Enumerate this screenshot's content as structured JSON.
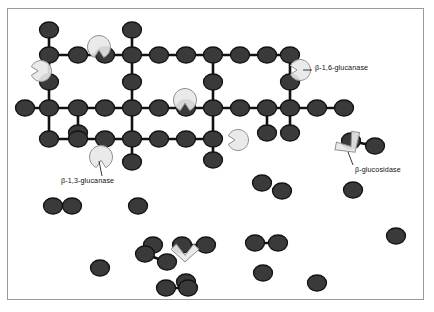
{
  "figure": {
    "background_color": "#ffffff",
    "border_color": "#9a9a9a",
    "unit_color": "#3a3a3a",
    "unit_stroke_color": "#121212",
    "bond_color": "#121212",
    "enzyme_fill_color": "#e8e8e8",
    "enzyme_stroke_color": "#8f8f8f",
    "leader_color": "#222222",
    "text_color": "#111111"
  },
  "labels": [
    {
      "id": "beta-1-6-glucanase",
      "text": "β-1,6-glucanase",
      "x": 315,
      "y": 68,
      "leader": {
        "x1": 303,
        "y1": 70,
        "x2": 312,
        "y2": 70
      }
    },
    {
      "id": "beta-1-3-glucanase",
      "text": "β-1,3-glucanase",
      "x": 61,
      "y": 181,
      "leader": {
        "x1": 102,
        "y1": 176,
        "x2": 99,
        "y2": 161
      }
    },
    {
      "id": "beta-glucosidase",
      "text": "β-glucosidase",
      "x": 355,
      "y": 170,
      "leader": {
        "x1": 353,
        "y1": 165,
        "x2": 348,
        "y2": 152
      }
    }
  ],
  "network": {
    "description": "Cross-linked beta-glucan polymer: glucose units joined by backbone and branch bonds",
    "unit_rx": 9.5,
    "unit_ry": 8.0,
    "bond_width": 2.6,
    "bonds": [
      [
        49,
        30,
        49,
        55
      ],
      [
        49,
        55,
        49,
        82
      ],
      [
        49,
        82,
        49,
        108
      ],
      [
        49,
        108,
        49,
        139
      ],
      [
        49,
        55,
        78,
        55
      ],
      [
        78,
        55,
        105,
        55
      ],
      [
        105,
        55,
        132,
        55
      ],
      [
        132,
        55,
        159,
        55
      ],
      [
        159,
        55,
        186,
        55
      ],
      [
        186,
        55,
        213,
        55
      ],
      [
        213,
        55,
        240,
        55
      ],
      [
        240,
        55,
        267,
        55
      ],
      [
        267,
        55,
        290,
        55
      ],
      [
        132,
        30,
        132,
        55
      ],
      [
        132,
        55,
        132,
        82
      ],
      [
        132,
        82,
        132,
        108
      ],
      [
        132,
        108,
        132,
        139
      ],
      [
        132,
        139,
        132,
        162
      ],
      [
        213,
        55,
        213,
        82
      ],
      [
        213,
        82,
        213,
        108
      ],
      [
        213,
        108,
        213,
        139
      ],
      [
        213,
        139,
        213,
        160
      ],
      [
        290,
        55,
        290,
        82
      ],
      [
        290,
        82,
        290,
        108
      ],
      [
        290,
        108,
        290,
        133
      ],
      [
        25,
        108,
        49,
        108
      ],
      [
        49,
        108,
        78,
        108
      ],
      [
        78,
        108,
        105,
        108
      ],
      [
        105,
        108,
        132,
        108
      ],
      [
        132,
        108,
        159,
        108
      ],
      [
        159,
        108,
        186,
        108
      ],
      [
        186,
        108,
        213,
        108
      ],
      [
        213,
        108,
        240,
        108
      ],
      [
        240,
        108,
        267,
        108
      ],
      [
        267,
        108,
        290,
        108
      ],
      [
        290,
        108,
        317,
        108
      ],
      [
        317,
        108,
        344,
        108
      ],
      [
        78,
        108,
        78,
        133
      ],
      [
        49,
        139,
        78,
        139
      ],
      [
        78,
        139,
        105,
        139
      ],
      [
        105,
        139,
        132,
        139
      ],
      [
        132,
        139,
        159,
        139
      ],
      [
        159,
        139,
        186,
        139
      ],
      [
        186,
        139,
        213,
        139
      ],
      [
        78,
        133,
        78,
        139
      ],
      [
        267,
        108,
        267,
        133
      ]
    ],
    "units": [
      [
        49,
        30
      ],
      [
        49,
        55
      ],
      [
        49,
        82
      ],
      [
        49,
        108
      ],
      [
        49,
        139
      ],
      [
        78,
        55
      ],
      [
        105,
        55
      ],
      [
        132,
        55
      ],
      [
        159,
        55
      ],
      [
        186,
        55
      ],
      [
        213,
        55
      ],
      [
        240,
        55
      ],
      [
        267,
        55
      ],
      [
        290,
        55
      ],
      [
        132,
        30
      ],
      [
        132,
        82
      ],
      [
        132,
        108
      ],
      [
        132,
        139
      ],
      [
        132,
        162
      ],
      [
        213,
        82
      ],
      [
        213,
        108
      ],
      [
        213,
        139
      ],
      [
        213,
        160
      ],
      [
        290,
        82
      ],
      [
        290,
        108
      ],
      [
        290,
        133
      ],
      [
        25,
        108
      ],
      [
        78,
        108
      ],
      [
        105,
        108
      ],
      [
        159,
        108
      ],
      [
        186,
        108
      ],
      [
        240,
        108
      ],
      [
        267,
        108
      ],
      [
        317,
        108
      ],
      [
        344,
        108
      ],
      [
        78,
        133
      ],
      [
        78,
        139
      ],
      [
        105,
        139
      ],
      [
        159,
        139
      ],
      [
        186,
        139
      ],
      [
        267,
        133
      ]
    ]
  },
  "enzymes": [
    {
      "id": "glucanase-top-left",
      "type": "pacman",
      "x": 99,
      "y": 47,
      "r": 11.5,
      "notch": "down"
    },
    {
      "id": "glucanase-left-edge",
      "type": "pacman",
      "x": 41,
      "y": 71,
      "r": 10.5,
      "notch": "left"
    },
    {
      "id": "glucanase-middle",
      "type": "pacman",
      "x": 185,
      "y": 100,
      "r": 11.5,
      "notch": "down"
    },
    {
      "id": "glucanase-right",
      "type": "pacman",
      "x": 300,
      "y": 70,
      "r": 10.5,
      "notch": "left"
    },
    {
      "id": "glucanase-lower-right",
      "type": "pacman",
      "x": 238,
      "y": 140,
      "r": 10.5,
      "notch": "left"
    },
    {
      "id": "glucanase-bottom-left",
      "type": "pacman",
      "x": 101,
      "y": 157,
      "r": 11.5,
      "notch": "down"
    },
    {
      "id": "glucosidase-right",
      "type": "chevron",
      "x": 352,
      "y": 148,
      "size": 15,
      "rotation": -35
    },
    {
      "id": "glucosidase-bottom",
      "type": "chevron",
      "x": 185,
      "y": 257,
      "size": 14,
      "rotation": 0
    }
  ],
  "free_units": {
    "description": "Released glucose and disaccharide fragments",
    "singles": [
      [
        282,
        191
      ],
      [
        353,
        190
      ],
      [
        138,
        206
      ],
      [
        153,
        245
      ],
      [
        100,
        268
      ],
      [
        186,
        282
      ],
      [
        263,
        273
      ],
      [
        317,
        283
      ],
      [
        396,
        236
      ],
      [
        262,
        183
      ]
    ],
    "pairs": [
      [
        [
          53,
          206
        ],
        [
          72,
          206
        ]
      ],
      [
        [
          145,
          254
        ],
        [
          167,
          262
        ]
      ],
      [
        [
          182,
          245
        ],
        [
          206,
          245
        ]
      ],
      [
        [
          255,
          243
        ],
        [
          278,
          243
        ]
      ],
      [
        [
          166,
          288
        ],
        [
          188,
          288
        ]
      ],
      [
        [
          351,
          141
        ],
        [
          375,
          146
        ]
      ]
    ]
  }
}
